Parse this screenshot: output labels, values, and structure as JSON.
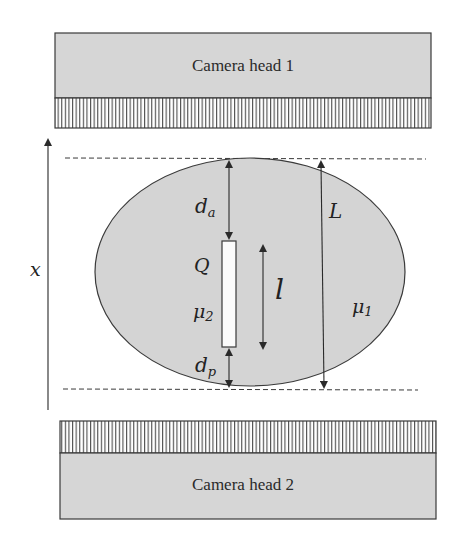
{
  "diagram": {
    "colors": {
      "background": "#ffffff",
      "camera_fill": "#d6d6d6",
      "ellipse_fill": "#d4d4d4",
      "source_fill": "#fbfbfb",
      "stroke": "#3a3a3a"
    },
    "camera_heads": [
      {
        "label": "Camera head 1",
        "position": "top"
      },
      {
        "label": "Camera head 2",
        "position": "bottom"
      }
    ],
    "axis": {
      "label": "x"
    },
    "labels": {
      "d_a": {
        "base": "d",
        "sub": "a"
      },
      "d_p": {
        "base": "d",
        "sub": "p"
      },
      "Q": "Q",
      "mu2": {
        "base": "μ",
        "sub": "2"
      },
      "mu1": {
        "base": "μ",
        "sub": "1"
      },
      "l": "l",
      "L": "L"
    }
  }
}
